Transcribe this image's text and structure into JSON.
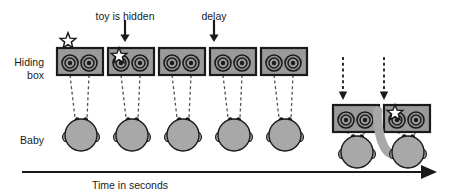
{
  "figure": {
    "title_annotations": [
      {
        "id": "toy-hidden",
        "text": "toy is hidden",
        "x": 125,
        "y": 10,
        "arrow_x": 125,
        "arrow_top": 20,
        "arrow_bottom": 42
      },
      {
        "id": "delay",
        "text": "delay",
        "x": 214,
        "y": 10,
        "arrow_x": 214,
        "arrow_top": 20,
        "arrow_bottom": 42
      }
    ],
    "row_labels": [
      {
        "id": "hiding-box",
        "lines": [
          "Hiding",
          "box"
        ],
        "x": 44,
        "y": 56
      },
      {
        "id": "baby",
        "lines": [
          "Baby"
        ],
        "x": 44,
        "y": 134
      }
    ],
    "axis": {
      "label": "Time in seconds",
      "label_x": 130,
      "label_y": 179,
      "line_x1": 22,
      "line_x2": 437,
      "line_y": 172,
      "arrowhead": true
    },
    "colors": {
      "box_fill": "#9a9a9a",
      "box_stroke": "#1a1a1a",
      "head_fill": "#a8a8a8",
      "head_stroke": "#1a1a1a",
      "star_fill": "#ffffff",
      "star_stroke": "#1a1a1a",
      "arrow": "#1a1a1a",
      "dash": "#555555",
      "text": "#1a1a1a",
      "background": "#ffffff"
    },
    "scenes": [
      {
        "id": "scene-1",
        "box_x": 57,
        "box_y": 48,
        "star": "above-left",
        "star_x": 68,
        "star_y": 41,
        "head_x": 81,
        "head_y": 135,
        "arm": false
      },
      {
        "id": "scene-2",
        "box_x": 108,
        "box_y": 48,
        "star": "inside-left",
        "star_x": 119,
        "star_y": 56,
        "head_x": 132,
        "head_y": 135,
        "arm": false
      },
      {
        "id": "scene-3",
        "box_x": 159,
        "box_y": 48,
        "star": "none",
        "head_x": 183,
        "head_y": 135,
        "arm": false
      },
      {
        "id": "scene-4",
        "box_x": 210,
        "box_y": 48,
        "star": "none",
        "head_x": 234,
        "head_y": 135,
        "arm": false
      },
      {
        "id": "scene-5",
        "box_x": 261,
        "box_y": 48,
        "star": "none",
        "head_x": 285,
        "head_y": 135,
        "arm": false
      },
      {
        "id": "scene-6",
        "box_x": 333,
        "box_y": 105,
        "star": "none",
        "head_x": 357,
        "head_y": 152,
        "arm": false
      },
      {
        "id": "scene-7",
        "box_x": 384,
        "box_y": 105,
        "star": "inside-left",
        "star_x": 395,
        "star_y": 113,
        "head_x": 408,
        "head_y": 152,
        "arm": true
      }
    ],
    "drop_arrows": [
      {
        "id": "drop-arrow-1",
        "x": 343,
        "top": 57,
        "bottom": 100
      },
      {
        "id": "drop-arrow-2",
        "x": 384,
        "top": 57,
        "bottom": 100
      }
    ],
    "box_geometry": {
      "w": 46,
      "h": 27,
      "circle_cx1": 13,
      "circle_cx2": 32,
      "circle_cy": 15,
      "r_outer": 8,
      "r_mid": 5,
      "r_inner": 2.2
    },
    "head_geometry": {
      "r": 16
    }
  }
}
